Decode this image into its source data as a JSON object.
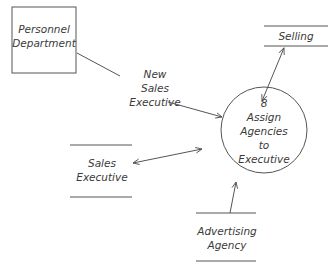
{
  "diagram": {
    "type": "data-flow-diagram",
    "external_entity": {
      "label_lines": [
        "Personnel",
        "Department"
      ]
    },
    "process": {
      "number": "8",
      "label_lines": [
        "Assign",
        "Agencies",
        "to",
        "Executive"
      ]
    },
    "data_stores": [
      {
        "id": "selling",
        "label_lines": [
          "Selling"
        ]
      },
      {
        "id": "sales-executive",
        "label_lines": [
          "Sales",
          "Executive"
        ]
      },
      {
        "id": "advertising-agency",
        "label_lines": [
          "Advertising",
          "Agency"
        ]
      }
    ],
    "flows": [
      {
        "from": "Personnel Department",
        "to": "Assign Agencies to Executive",
        "label_lines": [
          "New",
          "Sales",
          "Executive"
        ],
        "direction": "one-way"
      },
      {
        "from": "Assign Agencies to Executive",
        "to": "Selling",
        "label_lines": [],
        "direction": "two-way"
      },
      {
        "from": "Assign Agencies to Executive",
        "to": "Sales Executive",
        "label_lines": [],
        "direction": "two-way"
      },
      {
        "from": "Advertising Agency",
        "to": "Assign Agencies to Executive",
        "label_lines": [],
        "direction": "one-way"
      }
    ],
    "colors": {
      "stroke": "#555555",
      "text": "#3a3a3a",
      "background": "#ffffff"
    }
  }
}
